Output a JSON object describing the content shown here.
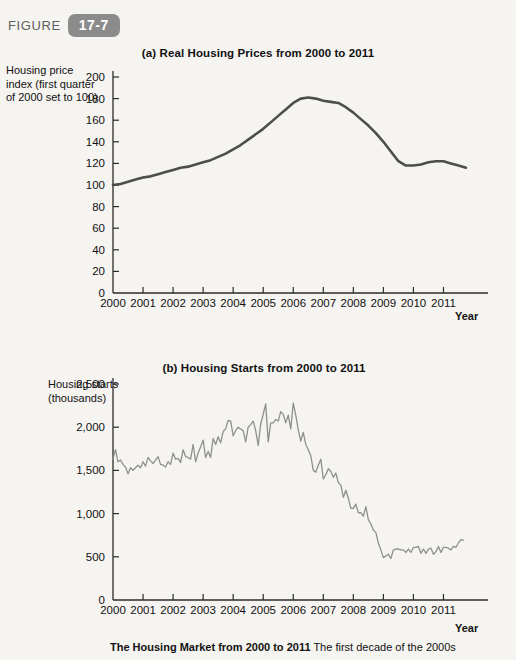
{
  "figure": {
    "label": "FIGURE",
    "number": "17-7",
    "badge_color": "#8b8b8b"
  },
  "caption": {
    "title": "The Housing Market from 2000 to 2011",
    "body": "The first decade of the 2000s"
  },
  "panel_a": {
    "title": "(a) Real Housing Prices from 2000 to 2011",
    "ylabel": "Housing price index (first quarter of 2000 set to 100)",
    "xlabel": "Year"
  },
  "panel_b": {
    "title": "(b) Housing Starts from 2000 to 2011",
    "ylabel": "Housing starts (thousands)",
    "xlabel": "Year"
  },
  "chart_data": [
    {
      "type": "line",
      "id": "real-housing-prices",
      "title": "(a) Real Housing Prices from 2000 to 2011",
      "xlabel": "Year",
      "ylabel": "Housing price index (first quarter of 2000 set to 100)",
      "xlim": [
        2000,
        2011.75
      ],
      "ylim": [
        0,
        200
      ],
      "ytick_values": [
        0,
        20,
        40,
        60,
        80,
        100,
        120,
        140,
        160,
        180,
        200
      ],
      "ytick_labels": [
        "0",
        "20",
        "40",
        "60",
        "80",
        "100",
        "120",
        "140",
        "160",
        "180",
        "200"
      ],
      "xtick_values": [
        2000,
        2001,
        2002,
        2003,
        2004,
        2005,
        2006,
        2007,
        2008,
        2009,
        2010,
        2011
      ],
      "xtick_labels": [
        "2000",
        "2001",
        "2002",
        "2003",
        "2004",
        "2005",
        "2006",
        "2007",
        "2008",
        "2009",
        "2010",
        "2011"
      ],
      "grid": false,
      "legend": "none",
      "line_color": "#4d4d4d",
      "line_width": 2.6,
      "x": [
        2000.0,
        2000.25,
        2000.5,
        2000.75,
        2001.0,
        2001.25,
        2001.5,
        2001.75,
        2002.0,
        2002.25,
        2002.5,
        2002.75,
        2003.0,
        2003.25,
        2003.5,
        2003.75,
        2004.0,
        2004.25,
        2004.5,
        2004.75,
        2005.0,
        2005.25,
        2005.5,
        2005.75,
        2006.0,
        2006.25,
        2006.5,
        2006.75,
        2007.0,
        2007.25,
        2007.5,
        2007.75,
        2008.0,
        2008.25,
        2008.5,
        2008.75,
        2009.0,
        2009.25,
        2009.5,
        2009.75,
        2010.0,
        2010.25,
        2010.5,
        2010.75,
        2011.0,
        2011.25,
        2011.5,
        2011.75
      ],
      "y": [
        100,
        101,
        103,
        105,
        107,
        108,
        110,
        112,
        114,
        116,
        117,
        119,
        121,
        123,
        126,
        129,
        133,
        137,
        142,
        147,
        152,
        158,
        164,
        170,
        176,
        180,
        181,
        180,
        178,
        177,
        176,
        172,
        167,
        161,
        155,
        148,
        140,
        131,
        122,
        118,
        118,
        119,
        121,
        122,
        122,
        120,
        118,
        116
      ]
    },
    {
      "type": "line",
      "id": "housing-starts",
      "title": "(b) Housing Starts from 2000 to 2011",
      "xlabel": "Year",
      "ylabel": "Housing starts (thousands)",
      "xlim": [
        2000,
        2011.75
      ],
      "ylim": [
        0,
        2500
      ],
      "ytick_values": [
        0,
        500,
        1000,
        1500,
        2000,
        2500
      ],
      "ytick_labels": [
        "0",
        "500",
        "1,000",
        "1,500",
        "2,000",
        "2,500"
      ],
      "xtick_values": [
        2000,
        2001,
        2002,
        2003,
        2004,
        2005,
        2006,
        2007,
        2008,
        2009,
        2010,
        2011
      ],
      "xtick_labels": [
        "2000",
        "2001",
        "2002",
        "2003",
        "2004",
        "2005",
        "2006",
        "2007",
        "2008",
        "2009",
        "2010",
        "2011"
      ],
      "grid": false,
      "legend": "none",
      "line_color": "#8f8f8f",
      "line_width": 1.3,
      "note": "monthly seasonally-adjusted annual rate, thousands of units",
      "x": [
        2000.0,
        2000.083,
        2000.167,
        2000.25,
        2000.333,
        2000.417,
        2000.5,
        2000.583,
        2000.667,
        2000.75,
        2000.833,
        2000.917,
        2001.0,
        2001.083,
        2001.167,
        2001.25,
        2001.333,
        2001.417,
        2001.5,
        2001.583,
        2001.667,
        2001.75,
        2001.833,
        2001.917,
        2002.0,
        2002.083,
        2002.167,
        2002.25,
        2002.333,
        2002.417,
        2002.5,
        2002.583,
        2002.667,
        2002.75,
        2002.833,
        2002.917,
        2003.0,
        2003.083,
        2003.167,
        2003.25,
        2003.333,
        2003.417,
        2003.5,
        2003.583,
        2003.667,
        2003.75,
        2003.833,
        2003.917,
        2004.0,
        2004.083,
        2004.167,
        2004.25,
        2004.333,
        2004.417,
        2004.5,
        2004.583,
        2004.667,
        2004.75,
        2004.833,
        2004.917,
        2005.0,
        2005.083,
        2005.167,
        2005.25,
        2005.333,
        2005.417,
        2005.5,
        2005.583,
        2005.667,
        2005.75,
        2005.833,
        2005.917,
        2006.0,
        2006.083,
        2006.167,
        2006.25,
        2006.333,
        2006.417,
        2006.5,
        2006.583,
        2006.667,
        2006.75,
        2006.833,
        2006.917,
        2007.0,
        2007.083,
        2007.167,
        2007.25,
        2007.333,
        2007.417,
        2007.5,
        2007.583,
        2007.667,
        2007.75,
        2007.833,
        2007.917,
        2008.0,
        2008.083,
        2008.167,
        2008.25,
        2008.333,
        2008.417,
        2008.5,
        2008.583,
        2008.667,
        2008.75,
        2008.833,
        2008.917,
        2009.0,
        2009.083,
        2009.167,
        2009.25,
        2009.333,
        2009.417,
        2009.5,
        2009.583,
        2009.667,
        2009.75,
        2009.833,
        2009.917,
        2010.0,
        2010.083,
        2010.167,
        2010.25,
        2010.333,
        2010.417,
        2010.5,
        2010.583,
        2010.667,
        2010.75,
        2010.833,
        2010.917,
        2011.0,
        2011.083,
        2011.167,
        2011.25,
        2011.333,
        2011.417,
        2011.5,
        2011.583,
        2011.667,
        2011.75
      ],
      "y": [
        1630,
        1740,
        1600,
        1620,
        1570,
        1540,
        1460,
        1530,
        1500,
        1530,
        1560,
        1530,
        1600,
        1550,
        1650,
        1610,
        1580,
        1620,
        1660,
        1570,
        1560,
        1540,
        1600,
        1570,
        1700,
        1630,
        1640,
        1590,
        1740,
        1660,
        1650,
        1630,
        1800,
        1600,
        1700,
        1770,
        1850,
        1650,
        1720,
        1650,
        1870,
        1800,
        1890,
        1820,
        1950,
        1980,
        2080,
        2070,
        1900,
        1960,
        2000,
        1980,
        1960,
        1830,
        2000,
        2030,
        2070,
        1960,
        1790,
        2040,
        2150,
        2270,
        1830,
        2050,
        2050,
        2090,
        2070,
        2180,
        2150,
        2050,
        2140,
        1980,
        2280,
        2140,
        1970,
        1840,
        1940,
        1800,
        1740,
        1670,
        1500,
        1480,
        1560,
        1630,
        1400,
        1450,
        1520,
        1490,
        1420,
        1470,
        1360,
        1330,
        1190,
        1270,
        1180,
        1060,
        1060,
        1110,
        1010,
        1010,
        970,
        1080,
        930,
        880,
        810,
        780,
        660,
        580,
        490,
        510,
        530,
        480,
        580,
        590,
        590,
        580,
        580,
        550,
        590,
        550,
        610,
        610,
        620,
        540,
        590,
        540,
        590,
        600,
        530,
        560,
        620,
        550,
        610,
        610,
        600,
        580,
        620,
        610,
        660,
        700,
        690
      ]
    }
  ]
}
